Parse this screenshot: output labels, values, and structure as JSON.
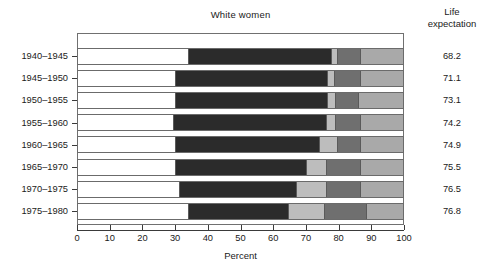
{
  "chart_data": {
    "type": "bar",
    "subtype": "stacked-horizontal-100pct",
    "title": "White women",
    "xlabel": "Percent",
    "ylabel": "",
    "xlim": [
      0,
      100
    ],
    "xticks": [
      0,
      10,
      20,
      30,
      40,
      50,
      60,
      70,
      80,
      90,
      100
    ],
    "xticklabels": [
      "0",
      "10",
      "20",
      "30",
      "40",
      "50",
      "60",
      "70",
      "80",
      "90",
      "100"
    ],
    "grid": false,
    "legend": "none",
    "categories": [
      "1940–1945",
      "1945–1950",
      "1950–1955",
      "1955–1960",
      "1960–1965",
      "1965–1970",
      "1970–1975",
      "1975–1980"
    ],
    "series": [
      {
        "name": "segment-1",
        "color": "#ffffff",
        "values": [
          34.0,
          30.0,
          30.0,
          29.5,
          30.0,
          30.0,
          31.5,
          34.0
        ]
      },
      {
        "name": "segment-2",
        "color": "#2b2b2b",
        "values": [
          44.0,
          47.0,
          47.0,
          47.0,
          44.5,
          40.5,
          36.0,
          31.0
        ]
      },
      {
        "name": "segment-3",
        "color": "#bdbdbd",
        "values": [
          2.0,
          2.0,
          2.5,
          3.0,
          5.5,
          6.0,
          9.0,
          11.0
        ]
      },
      {
        "name": "segment-4",
        "color": "#6f6f6f",
        "values": [
          7.0,
          8.0,
          7.0,
          7.5,
          7.0,
          10.5,
          10.5,
          13.0
        ]
      },
      {
        "name": "segment-5",
        "color": "#a9a9a9",
        "values": [
          13.0,
          13.0,
          13.5,
          13.0,
          13.0,
          13.0,
          13.0,
          11.0
        ]
      }
    ],
    "cumulative_boundaries": [
      [
        34.0,
        78.0,
        80.0,
        87.0,
        100.0
      ],
      [
        30.0,
        77.0,
        79.0,
        87.0,
        100.0
      ],
      [
        30.0,
        77.0,
        79.5,
        86.5,
        100.0
      ],
      [
        29.5,
        76.5,
        79.5,
        87.0,
        100.0
      ],
      [
        30.0,
        74.5,
        80.0,
        87.0,
        100.0
      ],
      [
        30.0,
        70.5,
        76.5,
        87.0,
        100.0
      ],
      [
        31.5,
        67.5,
        76.5,
        87.0,
        100.0
      ],
      [
        34.0,
        65.0,
        76.0,
        89.0,
        100.0
      ]
    ],
    "annotation_column": {
      "header_line1": "Life",
      "header_line2": "expectation",
      "values": [
        "68.2",
        "71.1",
        "73.1",
        "74.2",
        "74.9",
        "75.5",
        "76.5",
        "76.8"
      ]
    }
  },
  "colors": {
    "segment_1": "#ffffff",
    "segment_2": "#2b2b2b",
    "segment_3": "#bdbdbd",
    "segment_4": "#6f6f6f",
    "segment_5": "#a9a9a9",
    "axis": "#3a3a3a",
    "frame": "#707070",
    "text": "#1a1a1a",
    "background": "#ffffff"
  }
}
